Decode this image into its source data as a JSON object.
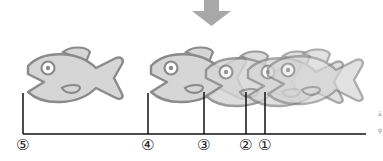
{
  "diagram": {
    "arrow": {
      "direction": "down",
      "color": "#a8a8a8"
    },
    "colors": {
      "fish_fill": "#d6d6d6",
      "fish_outline": "#8a8a8a",
      "fish_overlap_fill": "#b4b4b4",
      "axis": "#111111"
    },
    "markers": [
      {
        "id": "5",
        "label": "⑤",
        "x": 23
      },
      {
        "id": "4",
        "label": "④",
        "x": 148
      },
      {
        "id": "3",
        "label": "③",
        "x": 204
      },
      {
        "id": "2",
        "label": "②",
        "x": 246
      },
      {
        "id": "1",
        "label": "①",
        "x": 265
      }
    ],
    "fish_count": 5,
    "edge_marks": [
      "ä",
      "g"
    ]
  }
}
